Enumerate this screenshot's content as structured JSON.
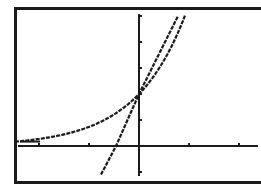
{
  "screen": {
    "type": "graphing-calculator-display",
    "frame_color": "#1a1a1a",
    "plot_color": "#1a1a1a",
    "background": "#ffffff"
  },
  "chart_data": {
    "type": "line",
    "title": "",
    "xlabel": "",
    "ylabel": "",
    "xlim": [
      -2.48,
      2.38
    ],
    "ylim": [
      -1.4,
      5.1
    ],
    "x_tick_spacing": 1,
    "y_tick_spacing": 1,
    "x_ticks": [
      -2,
      -1,
      1,
      2
    ],
    "y_ticks": [
      -1,
      1,
      2,
      3,
      4,
      5
    ],
    "grid": false,
    "legend": "none",
    "series": [
      {
        "name": "exponential curve",
        "x": [
          -2.48,
          -2.0,
          -1.5,
          -1.0,
          -0.5,
          0.0,
          0.5,
          0.8
        ],
        "y": [
          0.17,
          0.27,
          0.45,
          0.74,
          1.21,
          2.0,
          3.3,
          5.0
        ]
      },
      {
        "name": "line",
        "x": [
          -0.76,
          -0.46,
          0.0,
          0.78
        ],
        "y": [
          -1.1,
          0.0,
          2.0,
          5.0
        ]
      }
    ],
    "intersection": {
      "x": 0,
      "y": 2
    }
  }
}
